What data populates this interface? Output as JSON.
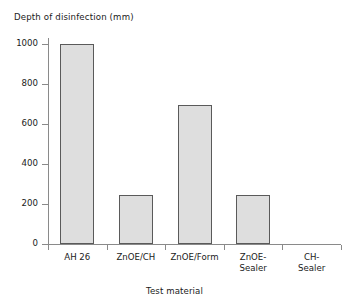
{
  "chart_data": {
    "type": "bar",
    "title": "",
    "subtitle": "",
    "ylabel": "Depth of disinfection (mm)",
    "xlabel": "Test material",
    "categories": [
      "AH 26",
      "ZnOE/CH",
      "ZnOE/Form",
      "ZnOE-\nSealer",
      "CH-\nSealer"
    ],
    "values": [
      1000,
      245,
      695,
      245,
      0
    ],
    "ylim": [
      0,
      1000
    ],
    "yticks": [
      0,
      200,
      400,
      600,
      800,
      1000
    ],
    "ytick_labels": [
      "0",
      "200",
      "400",
      "600",
      "800",
      "1000"
    ],
    "grid": false,
    "legend": "none",
    "bars": [
      {
        "category": "AH 26",
        "label": "AH 26",
        "value": 1000
      },
      {
        "category": "ZnOE/CH",
        "label": "ZnOE/CH",
        "value": 245
      },
      {
        "category": "ZnOE/Form",
        "label": "ZnOE/Form",
        "value": 695
      },
      {
        "category": "ZnOE-Sealer",
        "label": "ZnOE-\nSealer",
        "value": 245
      },
      {
        "category": "CH-Sealer",
        "label": "CH-\nSealer",
        "value": 0
      }
    ],
    "colors": {
      "bar_fill": "#dedede",
      "bar_edge": "#5a5a5a",
      "axis": "#8a8a8a",
      "text": "#1a1a1a",
      "background": "#ffffff"
    }
  }
}
